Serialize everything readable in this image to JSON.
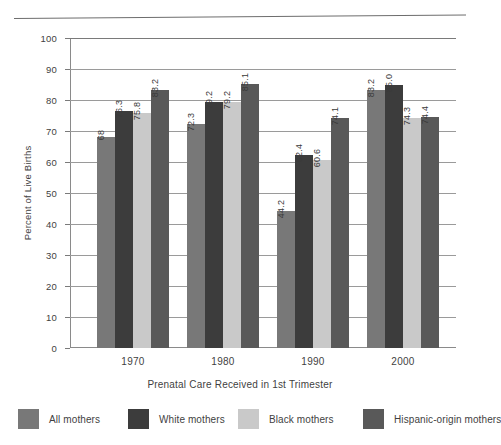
{
  "chart_data": {
    "type": "bar",
    "title": "",
    "xlabel": "Prenatal Care Received in 1st Trimester",
    "ylabel": "Percent of Live Births",
    "categories": [
      "1970",
      "1980",
      "1990",
      "2000"
    ],
    "ylim": [
      0,
      100
    ],
    "yticks": [
      "0",
      "10",
      "20",
      "30",
      "40",
      "50",
      "60",
      "70",
      "80",
      "90",
      "100"
    ],
    "grid": true,
    "legend_position": "bottom",
    "series": [
      {
        "name": "All mothers",
        "color": "#787878",
        "values": [
          68,
          72.3,
          44.2,
          83.2
        ],
        "labels": [
          "68",
          "72.3",
          "44.2",
          "83.2"
        ]
      },
      {
        "name": "White mothers",
        "color": "#3c3c3c",
        "values": [
          76.3,
          79.2,
          62.4,
          85.0
        ],
        "labels": [
          "76.3",
          "79.2",
          "62.4",
          "85.0"
        ]
      },
      {
        "name": "Black mothers",
        "color": "#c9c9c9",
        "values": [
          75.8,
          79.2,
          60.6,
          74.3
        ],
        "labels": [
          "75.8",
          "79.2",
          "60.6",
          "74.3"
        ]
      },
      {
        "name": "Hispanic-origin mothers",
        "color": "#595959",
        "values": [
          83.2,
          85.1,
          74.1,
          74.4
        ],
        "labels": [
          "83.2",
          "85.1",
          "74.1",
          "74.4"
        ]
      }
    ]
  }
}
